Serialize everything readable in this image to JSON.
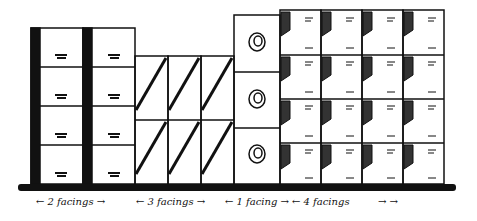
{
  "illustration": {
    "subject": "shelf facings diagram",
    "groups": [
      {
        "id": "group-1",
        "label": "2 facings",
        "columns": 2,
        "rows": 4
      },
      {
        "id": "group-2",
        "label": "3 facings",
        "columns": 3,
        "rows": 2
      },
      {
        "id": "group-3",
        "label": "1 facing",
        "columns": 1,
        "rows": 3
      },
      {
        "id": "group-4",
        "label": "4 facings",
        "columns": 4,
        "rows": 4
      }
    ]
  },
  "captions": {
    "c1": "← 2 facings →",
    "c2": "← 3 facings →",
    "c3": "← 1 facing →",
    "c4": "← 4 facings",
    "c4_arrows": "→   →"
  },
  "colors": {
    "ink": "#111111",
    "paper": "#ffffff"
  }
}
